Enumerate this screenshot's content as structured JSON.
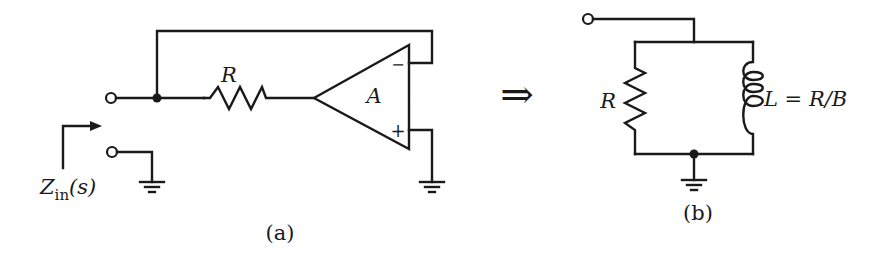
{
  "figure": {
    "panel_a": {
      "caption": "(a)",
      "resistor_label": "R",
      "amplifier_label": "A",
      "minus_label": "−",
      "plus_label": "+",
      "impedance_label_main": "Z",
      "impedance_label_sub": "in",
      "impedance_label_arg": "(s)"
    },
    "arrow": "⇒",
    "panel_b": {
      "caption": "(b)",
      "resistor_label": "R",
      "inductor_label": "L = R/B"
    }
  }
}
